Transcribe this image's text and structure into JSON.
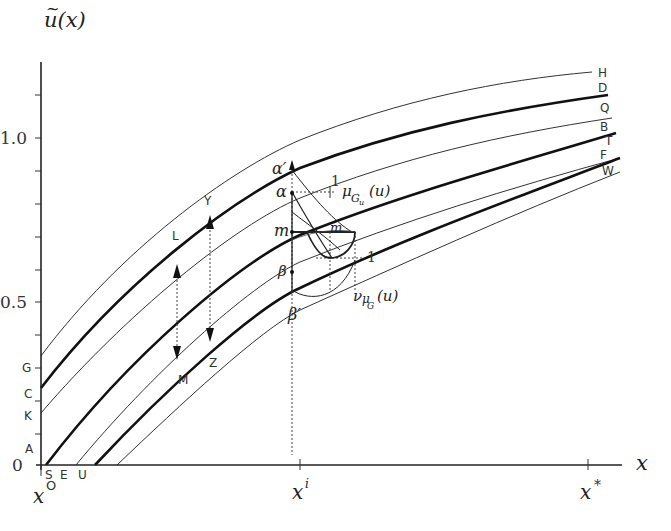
{
  "diagram": {
    "y_axis": {
      "label": "u(x)",
      "label_tilde": "~",
      "ticks": [
        "0",
        "0.5",
        "1.0"
      ],
      "left_labels": [
        "G",
        "C",
        "K",
        "A"
      ]
    },
    "x_axis": {
      "label": "x",
      "ticks": [
        "x",
        "x",
        "x"
      ],
      "tick_superscripts": [
        "O",
        "i",
        "*"
      ],
      "bottom_labels": [
        "S",
        "E",
        "U"
      ]
    },
    "curves": {
      "right_labels": [
        "H",
        "D",
        "Q",
        "B",
        "T",
        "F",
        "W"
      ],
      "thick": [
        "D",
        "B",
        "F"
      ],
      "thin": [
        "H",
        "Q",
        "T",
        "W"
      ]
    },
    "annotations": {
      "L": "L",
      "Y": "Y",
      "Z": "Z",
      "M": "M",
      "alpha_prime": "α′",
      "alpha": "α",
      "m": "m",
      "m_tilde": "m",
      "beta": "β",
      "beta_prime": "β′",
      "one_top": "1",
      "one_bottom": "1",
      "mu_main": "μ",
      "mu_sub": "G",
      "mu_subsub": "u",
      "mu_arg": "(u)",
      "nu_main": "ν",
      "nu_mu": "μ",
      "nu_sub": "G",
      "nu_arg": "(u)"
    }
  }
}
